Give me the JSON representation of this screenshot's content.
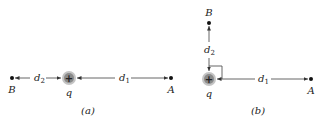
{
  "panels": [
    {
      "caption": "(a)",
      "charge": {
        "label": "q",
        "sign": "+"
      },
      "point_a": {
        "label": "A"
      },
      "point_b": {
        "label": "B"
      },
      "distance_1": {
        "label": "d",
        "sub": "1"
      },
      "distance_2": {
        "label": "d",
        "sub": "2"
      }
    },
    {
      "caption": "(b)",
      "charge": {
        "label": "q",
        "sign": "+"
      },
      "point_a": {
        "label": "A"
      },
      "point_b": {
        "label": "B"
      },
      "distance_1": {
        "label": "d",
        "sub": "1"
      },
      "distance_2": {
        "label": "d",
        "sub": "2"
      }
    }
  ],
  "colors": {
    "line": "#555555",
    "charge_fill": "#8a8a8a",
    "charge_halo": "#c4c4c4",
    "dot": "#111111"
  }
}
